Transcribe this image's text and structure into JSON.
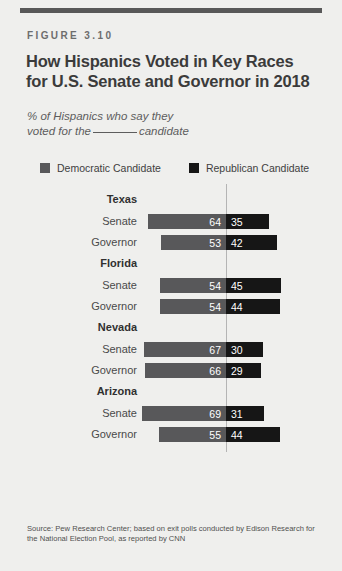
{
  "figure_label": "FIGURE 3.10",
  "title": {
    "line1": "How Hispanics Voted in Key Races",
    "line2": "for U.S. Senate and Governor in 2018"
  },
  "subtitle": {
    "line1": "% of Hispanics who say they",
    "line2_before": "voted for the",
    "line2_after": "candidate"
  },
  "legend": [
    {
      "label": "Democratic Candidate",
      "color": "#58585a",
      "icon": "square-swatch-icon"
    },
    {
      "label": "Republican Candidate",
      "color": "#161616",
      "icon": "square-swatch-icon"
    }
  ],
  "source": "Source: Pew Research Center; based on exit polls conducted by Edison Research for the National Election Pool, as reported by CNN",
  "colors": {
    "democratic": "#58585a",
    "republican": "#161616",
    "background": "#efefed",
    "top_rule": "#585858",
    "axis_line": "#b4b4b4"
  },
  "chart_data": {
    "type": "bar",
    "subtype": "diverging-stacked-bar",
    "title": "How Hispanics Voted in Key Races for U.S. Senate and Governor in 2018",
    "subtitle": "% of Hispanics who say they voted for the ____ candidate",
    "xlabel": "",
    "ylabel": "",
    "grid": false,
    "legend_position": "top",
    "categories": [
      "Texas Senate",
      "Texas Governor",
      "Florida Senate",
      "Florida Governor",
      "Nevada Senate",
      "Nevada Governor",
      "Arizona Senate",
      "Arizona Governor"
    ],
    "series": [
      {
        "name": "Democratic Candidate",
        "values": [
          64,
          53,
          54,
          54,
          67,
          66,
          69,
          55
        ]
      },
      {
        "name": "Republican Candidate",
        "values": [
          35,
          42,
          45,
          44,
          30,
          29,
          31,
          44
        ]
      }
    ],
    "groups": [
      {
        "state": "Texas",
        "rows": [
          {
            "race": "Senate",
            "democratic": 64,
            "republican": 35
          },
          {
            "race": "Governor",
            "democratic": 53,
            "republican": 42
          }
        ]
      },
      {
        "state": "Florida",
        "rows": [
          {
            "race": "Senate",
            "democratic": 54,
            "republican": 45
          },
          {
            "race": "Governor",
            "democratic": 54,
            "republican": 44
          }
        ]
      },
      {
        "state": "Nevada",
        "rows": [
          {
            "race": "Senate",
            "democratic": 67,
            "republican": 30
          },
          {
            "race": "Governor",
            "democratic": 66,
            "republican": 29
          }
        ]
      },
      {
        "state": "Arizona",
        "rows": [
          {
            "race": "Senate",
            "democratic": 69,
            "republican": 31
          },
          {
            "race": "Governor",
            "democratic": 55,
            "republican": 44
          }
        ]
      }
    ]
  }
}
